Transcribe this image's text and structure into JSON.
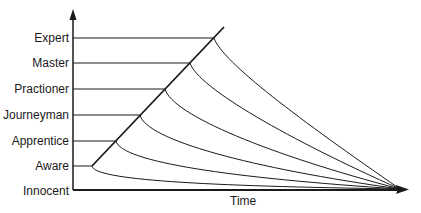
{
  "diagram": {
    "title": "",
    "x_axis_label": "Time",
    "levels": [
      {
        "name": "Expert",
        "y": 38,
        "diag_x": 214
      },
      {
        "name": "Master",
        "y": 63,
        "diag_x": 190
      },
      {
        "name": "Practioner",
        "y": 89,
        "diag_x": 165
      },
      {
        "name": "Journeyman",
        "y": 115,
        "diag_x": 140
      },
      {
        "name": "Apprentice",
        "y": 141,
        "diag_x": 116
      },
      {
        "name": "Aware",
        "y": 166,
        "diag_x": 92
      },
      {
        "name": "Innocent",
        "y": 190,
        "diag_x": null
      }
    ],
    "colors": {
      "line": "#1a1a1a",
      "background": "#ffffff"
    }
  }
}
